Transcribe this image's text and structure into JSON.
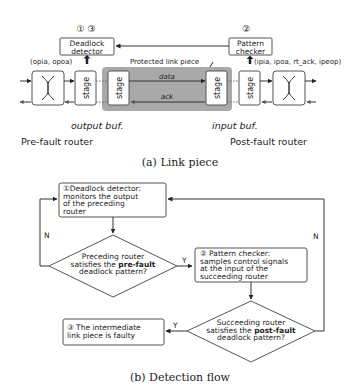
{
  "link_piece": {
    "detector_markers": "① ③",
    "detector_label_1": "Deadlock",
    "detector_label_2": "detector",
    "detector_signals": "(opia, opoa)",
    "checker_marker": "②",
    "checker_label_1": "Pattern",
    "checker_label_2": "checker",
    "checker_signals": "(ipia, ipoa, rt_ack, ipeop)",
    "protected_label": "Protected link piece",
    "data_label": "data",
    "ack_label": "ack",
    "stage_label": "stage",
    "output_buf_label": "output buf.",
    "input_buf_label": "input buf.",
    "pre_router_label": "Pre-fault router",
    "post_router_label": "Post-fault router",
    "caption": "(a) Link piece",
    "colors": {
      "protected_region": "#a9a9a9"
    }
  },
  "detection_flow": {
    "step1": [
      "①Deadlock detector:",
      "monitors the output",
      "of the preceding",
      "router"
    ],
    "decision1": [
      "Preceding router",
      "satisfies the ",
      "pre-fault",
      "deadlock pattern?"
    ],
    "step2": [
      "② Pattern checker:",
      "samples control signals",
      "at the input of the",
      "succeeding router"
    ],
    "decision2": [
      "Succeeding router",
      "satisfies the ",
      "post-fault",
      "deadlock pattern?"
    ],
    "step3": [
      "③ The intermediate",
      "link piece is faulty"
    ],
    "yes_label": "Y",
    "no_label": "N",
    "caption": "(b) Detection flow"
  }
}
